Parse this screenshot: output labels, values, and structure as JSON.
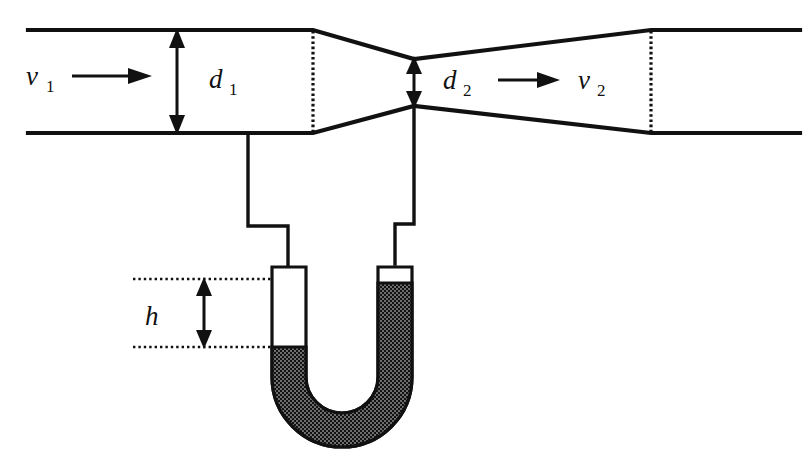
{
  "figure": {
    "labels": {
      "inlet_velocity": "v",
      "inlet_velocity_sub": "1",
      "inlet_diameter": "d",
      "inlet_diameter_sub": "1",
      "throat_diameter": "d",
      "throat_diameter_sub": "2",
      "throat_velocity": "v",
      "throat_velocity_sub": "2",
      "manometer_height": "h"
    },
    "colors": {
      "line": "#111111",
      "background": "#ffffff",
      "manometer_fluid": "#2b2b2b"
    }
  }
}
